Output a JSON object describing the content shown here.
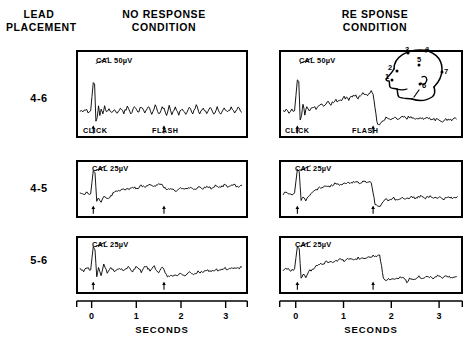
{
  "figure": {
    "lead_placement_header": "LEAD\nPLACEMENT",
    "columns": [
      {
        "id": "no-response",
        "header": "NO  RESPONSE\nCONDITION"
      },
      {
        "id": "response",
        "header": "RE SPONSE\nCONDITION"
      }
    ],
    "rows": [
      {
        "lead_label": "4-6"
      },
      {
        "lead_label": "4-5"
      },
      {
        "lead_label": "5-6"
      }
    ],
    "axis": {
      "title": "SECONDS",
      "ticks": [
        "0",
        "1",
        "2",
        "3"
      ]
    },
    "event_markers": {
      "click_label": "CLICK",
      "flash_label": "FLASH"
    },
    "calibrations": {
      "row0": "CAL 50µV",
      "row1": "CAL 25µV",
      "row2": "CAL 25µV"
    },
    "head_diagram": {
      "name": "electrode-placement-head-diagram",
      "electrode_labels": [
        "1",
        "2",
        "3",
        "4",
        "5",
        "6",
        "7"
      ]
    },
    "colors": {
      "ink": "#000000",
      "paper": "#ffffff"
    }
  },
  "chart_data": {
    "type": "line",
    "xlabel": "SECONDS",
    "ylabel": "",
    "xlim": [
      -0.35,
      3.5
    ],
    "xticks": [
      0,
      1,
      2,
      3
    ],
    "grid": false,
    "legend": "none",
    "annotations": [
      {
        "text": "CLICK",
        "x": 0.0,
        "note": "auditory stimulus onset arrow"
      },
      {
        "text": "FLASH",
        "x": 1.62,
        "note": "visual stimulus onset arrow"
      }
    ],
    "panels": [
      {
        "lead": "4-6",
        "condition": "NO RESPONSE",
        "calibration": "CAL 50µV",
        "calibration_uv": 50,
        "event_arrows_s": [
          0.0,
          1.62
        ],
        "series": [
          {
            "name": "EEG trace",
            "x": [
              -0.3,
              -0.24,
              -0.18,
              -0.12,
              -0.06,
              0.0,
              0.03,
              0.06,
              0.09,
              0.12,
              0.15,
              0.18,
              0.22,
              0.26,
              0.3,
              0.36,
              0.42,
              0.48,
              0.55,
              0.62,
              0.7,
              0.78,
              0.86,
              0.94,
              1.02,
              1.1,
              1.18,
              1.26,
              1.34,
              1.42,
              1.5,
              1.58,
              1.62,
              1.68,
              1.74,
              1.8,
              1.88,
              1.96,
              2.04,
              2.12,
              2.2,
              2.28,
              2.36,
              2.44,
              2.52,
              2.6,
              2.68,
              2.76,
              2.84,
              2.92,
              3.0,
              3.08,
              3.16,
              3.24,
              3.32,
              3.4
            ],
            "y": [
              0,
              -2,
              1,
              -1,
              0,
              42,
              40,
              -14,
              -10,
              6,
              -8,
              4,
              -3,
              8,
              -2,
              5,
              -4,
              3,
              -5,
              4,
              -3,
              6,
              -4,
              5,
              -3,
              7,
              -5,
              6,
              -4,
              8,
              -6,
              5,
              3,
              -9,
              7,
              -4,
              6,
              -5,
              4,
              -6,
              5,
              -3,
              7,
              -4,
              6,
              -5,
              4,
              -6,
              5,
              -4,
              6,
              -3,
              5,
              -4,
              6,
              -2
            ]
          }
        ]
      },
      {
        "lead": "4-6",
        "condition": "RESPONSE",
        "calibration": "CAL 50µV",
        "calibration_uv": 50,
        "event_arrows_s": [
          0.0,
          1.62
        ],
        "series": [
          {
            "name": "EEG trace",
            "x": [
              -0.3,
              -0.24,
              -0.18,
              -0.12,
              -0.06,
              0.0,
              0.03,
              0.06,
              0.09,
              0.12,
              0.16,
              0.2,
              0.26,
              0.32,
              0.4,
              0.48,
              0.56,
              0.64,
              0.72,
              0.8,
              0.9,
              1.0,
              1.1,
              1.2,
              1.3,
              1.4,
              1.5,
              1.58,
              1.62,
              1.66,
              1.7,
              1.74,
              1.78,
              1.84,
              1.92,
              2.0,
              2.08,
              2.16,
              2.24,
              2.32,
              2.4,
              2.5,
              2.6,
              2.7,
              2.8,
              2.9,
              3.0,
              3.1,
              3.2,
              3.3,
              3.4
            ],
            "y": [
              -2,
              2,
              -3,
              1,
              0,
              46,
              44,
              -12,
              -6,
              10,
              -7,
              6,
              0,
              6,
              4,
              9,
              7,
              13,
              10,
              16,
              14,
              20,
              17,
              24,
              20,
              26,
              22,
              28,
              26,
              4,
              -16,
              -22,
              -18,
              -14,
              -10,
              -13,
              -9,
              -12,
              -8,
              -11,
              -9,
              -12,
              -10,
              -13,
              -11,
              -14,
              -12,
              -15,
              -13,
              -14,
              -12
            ]
          }
        ]
      },
      {
        "lead": "4-5",
        "condition": "NO RESPONSE",
        "calibration": "CAL 25µV",
        "calibration_uv": 25,
        "event_arrows_s": [
          0.0,
          1.62
        ],
        "series": [
          {
            "name": "EEG trace",
            "x": [
              -0.3,
              -0.22,
              -0.14,
              -0.06,
              0.0,
              0.04,
              0.08,
              0.12,
              0.18,
              0.24,
              0.32,
              0.4,
              0.5,
              0.6,
              0.7,
              0.8,
              0.9,
              1.0,
              1.1,
              1.2,
              1.3,
              1.4,
              1.5,
              1.58,
              1.62,
              1.7,
              1.8,
              1.9,
              2.0,
              2.1,
              2.2,
              2.3,
              2.4,
              2.5,
              2.6,
              2.7,
              2.8,
              2.9,
              3.0,
              3.1,
              3.2,
              3.3,
              3.4
            ],
            "y": [
              0,
              -2,
              1,
              -1,
              40,
              36,
              -16,
              -8,
              -14,
              -6,
              -10,
              -4,
              2,
              5,
              8,
              6,
              11,
              9,
              13,
              11,
              15,
              13,
              16,
              14,
              10,
              6,
              8,
              5,
              9,
              6,
              10,
              7,
              11,
              8,
              12,
              9,
              13,
              10,
              14,
              11,
              15,
              12,
              14
            ]
          }
        ]
      },
      {
        "lead": "4-5",
        "condition": "RESPONSE",
        "calibration": "CAL 25µV",
        "calibration_uv": 25,
        "event_arrows_s": [
          0.0,
          1.62
        ],
        "series": [
          {
            "name": "EEG trace",
            "x": [
              -0.3,
              -0.22,
              -0.14,
              -0.06,
              0.0,
              0.04,
              0.08,
              0.12,
              0.18,
              0.24,
              0.32,
              0.4,
              0.5,
              0.6,
              0.7,
              0.8,
              0.9,
              1.0,
              1.1,
              1.2,
              1.3,
              1.4,
              1.5,
              1.58,
              1.62,
              1.66,
              1.72,
              1.8,
              1.88,
              1.96,
              2.04,
              2.14,
              2.24,
              2.34,
              2.44,
              2.54,
              2.64,
              2.74,
              2.84,
              2.94,
              3.04,
              3.14,
              3.24,
              3.34,
              3.42
            ],
            "y": [
              -1,
              2,
              -2,
              1,
              42,
              38,
              -14,
              -6,
              -12,
              -4,
              0,
              6,
              10,
              14,
              13,
              17,
              15,
              19,
              17,
              20,
              18,
              21,
              19,
              20,
              2,
              -18,
              -24,
              -20,
              -10,
              -14,
              -8,
              -12,
              -6,
              -10,
              -5,
              -9,
              -4,
              -8,
              -5,
              -9,
              -6,
              -10,
              -7,
              -9,
              -6
            ]
          }
        ]
      },
      {
        "lead": "5-6",
        "condition": "NO RESPONSE",
        "calibration": "CAL 25µV",
        "calibration_uv": 25,
        "event_arrows_s": [
          0.0,
          1.62
        ],
        "series": [
          {
            "name": "EEG trace",
            "x": [
              -0.3,
              -0.22,
              -0.14,
              -0.06,
              0.0,
              0.04,
              0.08,
              0.12,
              0.18,
              0.24,
              0.32,
              0.4,
              0.5,
              0.6,
              0.7,
              0.8,
              0.9,
              1.0,
              1.1,
              1.2,
              1.3,
              1.4,
              1.5,
              1.58,
              1.62,
              1.7,
              1.8,
              1.9,
              2.0,
              2.1,
              2.2,
              2.3,
              2.4,
              2.5,
              2.6,
              2.7,
              2.8,
              2.9,
              3.0,
              3.1,
              3.2,
              3.3,
              3.4
            ],
            "y": [
              0,
              -3,
              2,
              -1,
              40,
              34,
              -14,
              4,
              -10,
              8,
              -6,
              2,
              -4,
              3,
              -2,
              4,
              -3,
              5,
              -4,
              6,
              -3,
              5,
              -6,
              4,
              -2,
              -14,
              -10,
              -12,
              -8,
              -10,
              -6,
              -8,
              -4,
              -6,
              -2,
              -4,
              0,
              -2,
              2,
              0,
              3,
              1,
              4
            ]
          }
        ]
      },
      {
        "lead": "5-6",
        "condition": "RESPONSE",
        "calibration": "CAL 25µV",
        "calibration_uv": 25,
        "event_arrows_s": [
          0.0,
          1.62
        ],
        "series": [
          {
            "name": "EEG trace",
            "x": [
              -0.3,
              -0.22,
              -0.14,
              -0.06,
              0.0,
              0.04,
              0.08,
              0.12,
              0.18,
              0.24,
              0.32,
              0.4,
              0.5,
              0.6,
              0.7,
              0.8,
              0.9,
              1.0,
              1.1,
              1.2,
              1.3,
              1.4,
              1.5,
              1.58,
              1.62,
              1.7,
              1.76,
              1.8,
              1.84,
              1.9,
              2.0,
              2.1,
              2.2,
              2.3,
              2.34,
              2.4,
              2.5,
              2.6,
              2.7,
              2.8,
              2.9,
              3.0,
              3.1,
              3.2,
              3.3,
              3.4
            ],
            "y": [
              -2,
              2,
              -3,
              1,
              40,
              36,
              -16,
              -8,
              -14,
              -4,
              0,
              5,
              9,
              12,
              15,
              13,
              17,
              15,
              19,
              17,
              20,
              18,
              22,
              20,
              24,
              22,
              26,
              6,
              -16,
              -20,
              -16,
              -18,
              -14,
              -16,
              -24,
              -15,
              -17,
              -13,
              -16,
              -12,
              -15,
              -11,
              -14,
              -12,
              -15,
              -13
            ]
          }
        ]
      }
    ]
  }
}
